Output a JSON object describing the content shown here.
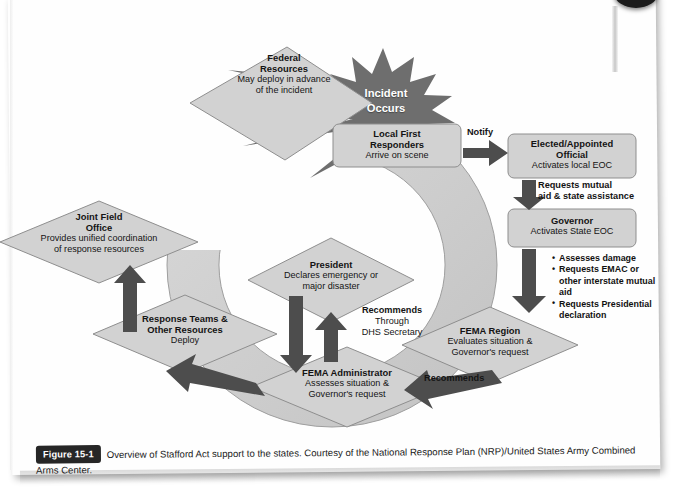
{
  "figure": {
    "badge": "Figure 15-1",
    "caption": "Overview of Stafford Act support to the states. Courtesy of the National Response Plan (NRP)/United States Army Combined Arms Center."
  },
  "diagram": {
    "type": "flow-diagram",
    "incident": {
      "line1": "Incident",
      "line2": "Occurs"
    },
    "nodes": [
      {
        "id": "federal-resources",
        "shape": "diamond",
        "title_lines": [
          "Federal",
          "Resources"
        ],
        "sub_lines": [
          "May deploy in advance",
          "of the incident"
        ]
      },
      {
        "id": "local-first-responders",
        "shape": "rounded-rect",
        "title_lines": [
          "Local First",
          "Responders"
        ],
        "sub_lines": [
          "Arrive on scene"
        ]
      },
      {
        "id": "elected-appointed-official",
        "shape": "rounded-rect",
        "title_lines": [
          "Elected/Appointed",
          "Official"
        ],
        "sub_lines": [
          "Activates local EOC"
        ]
      },
      {
        "id": "governor",
        "shape": "rounded-rect",
        "title_lines": [
          "Governor"
        ],
        "sub_lines": [
          "Activates State EOC"
        ]
      },
      {
        "id": "fema-region",
        "shape": "diamond",
        "title_lines": [
          "FEMA Region"
        ],
        "sub_lines": [
          "Evaluates situation &",
          "Governor's request"
        ]
      },
      {
        "id": "fema-administrator",
        "shape": "diamond",
        "title_lines": [
          "FEMA Administrator"
        ],
        "sub_lines": [
          "Assesses situation &",
          "Governor's request"
        ]
      },
      {
        "id": "president",
        "shape": "diamond",
        "title_lines": [
          "President"
        ],
        "sub_lines": [
          "Declares emergency or",
          "major disaster"
        ]
      },
      {
        "id": "response-teams",
        "shape": "diamond",
        "title_lines": [
          "Response Teams &",
          "Other Resources"
        ],
        "sub_lines": [
          "Deploy"
        ]
      },
      {
        "id": "joint-field-office",
        "shape": "diamond",
        "title_lines": [
          "Joint Field",
          "Office"
        ],
        "sub_lines": [
          "Provides unified coordination",
          "of response resources"
        ]
      }
    ],
    "edge_labels": [
      {
        "id": "notify",
        "bold_lines": [
          "Notify"
        ],
        "plain_lines": []
      },
      {
        "id": "requests-mutual-aid",
        "bold_lines": [
          "Requests mutual",
          "aid & state assistance"
        ],
        "plain_lines": []
      },
      {
        "id": "recommends-region",
        "bold_lines": [
          "Recommends"
        ],
        "plain_lines": []
      },
      {
        "id": "recommends-dhs",
        "bold_lines": [
          "Recommends"
        ],
        "plain_lines": [
          "Through",
          "DHS Secretary"
        ]
      }
    ],
    "governor_actions": [
      "Assesses damage",
      "Requests EMAC or other interstate mutual aid",
      "Requests Presidential declaration"
    ],
    "colors": {
      "node_fill": "#d2d2d2",
      "node_stroke": "#8c8c8c",
      "arc_fill": "#cfcfcf",
      "arc_stroke": "#9a9a9a",
      "arrow": "#4d4d4d",
      "burst_fill": "#6e6e6e",
      "text": "#141414",
      "badge_bg": "#262626"
    }
  }
}
